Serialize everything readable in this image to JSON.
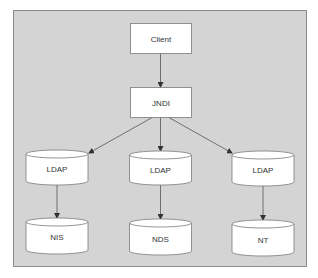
{
  "colors": {
    "frame_fill": "#d4d4d4",
    "frame_stroke": "#8a8a8a",
    "node_fill": "#ffffff",
    "node_stroke": "#7a7a7a",
    "edge": "#555555",
    "text": "#333333"
  },
  "nodes": [
    {
      "id": "client",
      "label": "Client",
      "shape": "rectangle"
    },
    {
      "id": "jndi",
      "label": "JNDI",
      "shape": "rectangle"
    },
    {
      "id": "ldap-left",
      "label": "LDAP",
      "shape": "cylinder"
    },
    {
      "id": "ldap-center",
      "label": "LDAP",
      "shape": "cylinder"
    },
    {
      "id": "ldap-right",
      "label": "LDAP",
      "shape": "cylinder"
    },
    {
      "id": "nis",
      "label": "NIS",
      "shape": "cylinder"
    },
    {
      "id": "nds",
      "label": "NDS",
      "shape": "cylinder"
    },
    {
      "id": "nt",
      "label": "NT",
      "shape": "cylinder"
    }
  ],
  "edges": [
    {
      "from": "client",
      "to": "jndi"
    },
    {
      "from": "jndi",
      "to": "ldap-left"
    },
    {
      "from": "jndi",
      "to": "ldap-center"
    },
    {
      "from": "jndi",
      "to": "ldap-right"
    },
    {
      "from": "ldap-left",
      "to": "nis"
    },
    {
      "from": "ldap-center",
      "to": "nds"
    },
    {
      "from": "ldap-right",
      "to": "nt"
    }
  ]
}
